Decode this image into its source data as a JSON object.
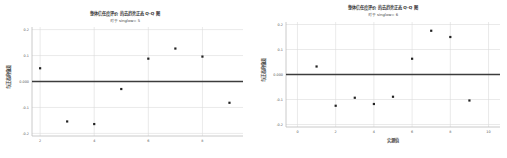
{
  "chart_data": [
    {
      "type": "scatter",
      "title": "整体信任度评价 的去趋势正态 Q-Q 图",
      "subtitle": "对于 singlow= 5",
      "xlabel": "",
      "ylabel": "与正态的偏差",
      "xlim": [
        1.7,
        9.5
      ],
      "ylim": [
        -0.21,
        0.21
      ],
      "xticks": [
        2,
        4,
        6,
        8
      ],
      "xtick_labels": [
        "2",
        "4",
        "6",
        "8"
      ],
      "yticks": [
        0.2,
        0.1,
        0.0,
        -0.1,
        -0.2
      ],
      "ytick_labels": [
        "0.2",
        "0.1",
        "0.000",
        "-0.1",
        "-0.2"
      ],
      "reference_line": 0.0,
      "grid": true,
      "points": [
        {
          "x": 2,
          "y": 0.051
        },
        {
          "x": 3,
          "y": -0.154
        },
        {
          "x": 4,
          "y": -0.164
        },
        {
          "x": 5,
          "y": -0.029
        },
        {
          "x": 6,
          "y": 0.088
        },
        {
          "x": 7,
          "y": 0.127
        },
        {
          "x": 8,
          "y": 0.096
        },
        {
          "x": 9,
          "y": -0.082
        }
      ]
    },
    {
      "type": "scatter",
      "title": "整体信任度评价 的去趋势正态 Q-Q 图",
      "subtitle": "对于 singlow= 6",
      "xlabel": "实测值",
      "ylabel": "与正态的偏差",
      "xlim": [
        -0.6,
        10.6
      ],
      "ylim": [
        -0.21,
        0.21
      ],
      "xticks": [
        0,
        2,
        4,
        6,
        8,
        10
      ],
      "xtick_labels": [
        "0",
        "2",
        "4",
        "6",
        "8",
        "10"
      ],
      "yticks": [
        0.2,
        0.1,
        0.0,
        -0.1,
        -0.2
      ],
      "ytick_labels": [
        "0.2",
        "0.1",
        "0.000",
        "-0.1",
        "-0.2"
      ],
      "reference_line": 0.0,
      "grid": true,
      "points": [
        {
          "x": 1,
          "y": 0.032
        },
        {
          "x": 2,
          "y": -0.125
        },
        {
          "x": 3,
          "y": -0.093
        },
        {
          "x": 4,
          "y": -0.118
        },
        {
          "x": 5,
          "y": -0.089
        },
        {
          "x": 6,
          "y": 0.063
        },
        {
          "x": 7,
          "y": 0.175
        },
        {
          "x": 8,
          "y": 0.15
        },
        {
          "x": 9,
          "y": -0.104
        }
      ]
    }
  ]
}
